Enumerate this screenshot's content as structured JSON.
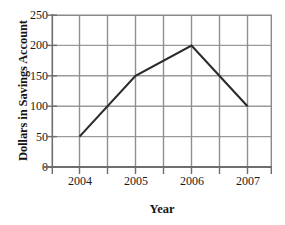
{
  "chart_data": {
    "type": "line",
    "title": "",
    "xlabel": "Year",
    "ylabel": "Dollars in Savings Account",
    "categories": [
      "2004",
      "2005",
      "2006",
      "2007"
    ],
    "x": [
      2004,
      2005,
      2006,
      2007
    ],
    "values": [
      50,
      150,
      200,
      100
    ],
    "series": [
      {
        "name": "Dollars in Savings Account",
        "values": [
          50,
          150,
          200,
          100
        ]
      }
    ],
    "ylim": [
      0,
      250
    ],
    "y_ticks": [
      0,
      50,
      100,
      150,
      200,
      250
    ],
    "y_tick_labels": [
      "0",
      "50",
      "100",
      "150",
      "200",
      "250"
    ],
    "x_tick_labels": [
      "2004",
      "2005",
      "2006",
      "2007"
    ],
    "grid": true,
    "grid_vertical_lines": 8,
    "legend": "none",
    "line_color": "#2b2b2b",
    "grid_color": "#9a9a9a",
    "axis_color": "#7d7d7d",
    "background_color": "#ffffff"
  },
  "axes": {
    "y_title": "Dollars in Savings Account",
    "x_title": "Year"
  }
}
